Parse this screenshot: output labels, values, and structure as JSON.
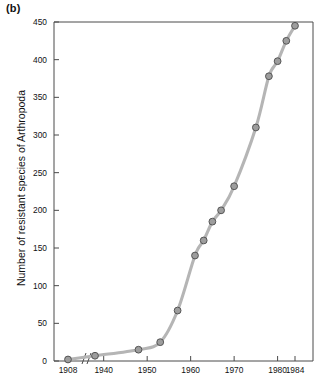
{
  "figure": {
    "panel_label": "(b)"
  },
  "chart_data": {
    "type": "line",
    "title": "",
    "subtitle": "",
    "xlabel": "",
    "ylabel": "Number of resistant species of Arthropoda",
    "xlim": [
      1904,
      1984
    ],
    "ylim": [
      0,
      450
    ],
    "grid": false,
    "legend": null,
    "axis_break": {
      "present": true,
      "between": [
        1910,
        1938
      ],
      "style": "double-slash"
    },
    "xticks": [
      1908,
      1940,
      1950,
      1960,
      1970,
      1980,
      1984
    ],
    "xtick_labels": [
      "1908",
      "1940",
      "1950",
      "1960",
      "1970",
      "1980",
      "1984"
    ],
    "yticks": [
      0,
      50,
      100,
      150,
      200,
      250,
      300,
      350,
      400,
      450
    ],
    "ytick_labels": [
      "0",
      "50",
      "100",
      "150",
      "200",
      "250",
      "300",
      "350",
      "400",
      "450"
    ],
    "series": [
      {
        "name": "Resistant species of Arthropoda",
        "marker": "circle",
        "marker_fill": "#9d9d9d",
        "marker_stroke": "#555555",
        "line_color": "#b5b5b5",
        "x": [
          1908,
          1938,
          1948,
          1953,
          1957,
          1961,
          1963,
          1965,
          1967,
          1970,
          1975,
          1978,
          1980,
          1982,
          1984
        ],
        "y": [
          2,
          7,
          15,
          25,
          67,
          140,
          160,
          185,
          200,
          232,
          310,
          378,
          398,
          425,
          445
        ]
      }
    ],
    "annotations": []
  }
}
